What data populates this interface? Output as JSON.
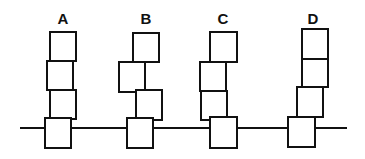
{
  "colors": {
    "stroke": "#111111",
    "fill": "#ffffff",
    "background": "#ffffff"
  },
  "baseline": {
    "x1": 20,
    "x2": 347,
    "y": 128
  },
  "stacks": [
    {
      "label": "A",
      "label_x": 63,
      "boxes": [
        {
          "x": 50,
          "y": 32,
          "w": 26,
          "h": 29
        },
        {
          "x": 47,
          "y": 61,
          "w": 26,
          "h": 29
        },
        {
          "x": 50,
          "y": 90,
          "w": 26,
          "h": 29
        },
        {
          "x": 45,
          "y": 118,
          "w": 26,
          "h": 30
        }
      ]
    },
    {
      "label": "B",
      "label_x": 146,
      "boxes": [
        {
          "x": 133,
          "y": 33,
          "w": 26,
          "h": 29
        },
        {
          "x": 119,
          "y": 62,
          "w": 26,
          "h": 30
        },
        {
          "x": 136,
          "y": 90,
          "w": 26,
          "h": 30
        },
        {
          "x": 127,
          "y": 118,
          "w": 26,
          "h": 30
        }
      ]
    },
    {
      "label": "C",
      "label_x": 223,
      "boxes": [
        {
          "x": 210,
          "y": 32,
          "w": 27,
          "h": 30
        },
        {
          "x": 200,
          "y": 62,
          "w": 26,
          "h": 29
        },
        {
          "x": 201,
          "y": 91,
          "w": 26,
          "h": 29
        },
        {
          "x": 210,
          "y": 117,
          "w": 27,
          "h": 31
        }
      ]
    },
    {
      "label": "D",
      "label_x": 313,
      "boxes": [
        {
          "x": 302,
          "y": 29,
          "w": 26,
          "h": 30
        },
        {
          "x": 302,
          "y": 59,
          "w": 26,
          "h": 28
        },
        {
          "x": 297,
          "y": 87,
          "w": 26,
          "h": 30
        },
        {
          "x": 288,
          "y": 117,
          "w": 27,
          "h": 30
        }
      ]
    }
  ]
}
